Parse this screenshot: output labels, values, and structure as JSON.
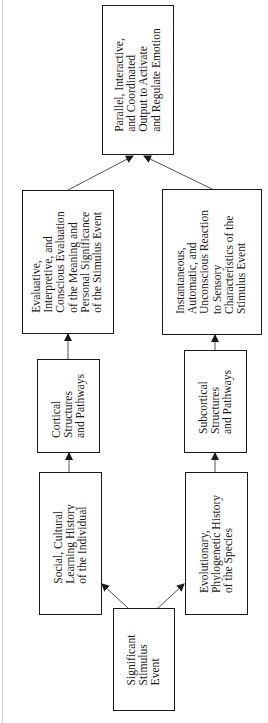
{
  "diagram": {
    "orientation": "rotated 90deg counter-clockwise (flow from bottom to top)",
    "nodes": [
      {
        "id": "stimulus",
        "label": "Significant\nStimulus\nEvent"
      },
      {
        "id": "social",
        "label": "Social, Cultural\nLearning History\nof the Individual"
      },
      {
        "id": "evolutionary",
        "label": "Evolutionary,\nPhylogenetic History\nof the Species"
      },
      {
        "id": "cortical",
        "label": "Cortical\nStructures\nand Pathways"
      },
      {
        "id": "subcortical",
        "label": "Subcortical\nStructures\nand Pathways"
      },
      {
        "id": "evaluative",
        "label": "Evaluative,\nInterpretive, and\nConscious Evaluation\nof the Meaning and\nPersonal Significance\nof the Stimulus Event"
      },
      {
        "id": "instantaneous",
        "label": "Instantaneous,\nAutomatic, and\nUnconscious Reaction\nto Sensory\nCharacteristics of the\nStimulus Event"
      },
      {
        "id": "output",
        "label": "Parallel, Interactive,\nand Coordinated\nOutput to Activate\nand Regulate Emotion"
      }
    ],
    "edges": [
      {
        "from": "stimulus",
        "to": "social"
      },
      {
        "from": "stimulus",
        "to": "evolutionary"
      },
      {
        "from": "social",
        "to": "cortical"
      },
      {
        "from": "evolutionary",
        "to": "subcortical"
      },
      {
        "from": "cortical",
        "to": "evaluative"
      },
      {
        "from": "subcortical",
        "to": "instantaneous"
      },
      {
        "from": "evaluative",
        "to": "output"
      },
      {
        "from": "instantaneous",
        "to": "output"
      }
    ]
  }
}
